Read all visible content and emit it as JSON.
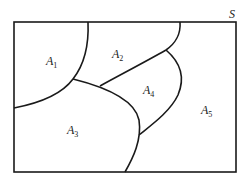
{
  "diagram": {
    "universe_label": "S",
    "regions": [
      {
        "id": "A1",
        "letter": "A",
        "sub": "1"
      },
      {
        "id": "A2",
        "letter": "A",
        "sub": "2"
      },
      {
        "id": "A3",
        "letter": "A",
        "sub": "3"
      },
      {
        "id": "A4",
        "letter": "A",
        "sub": "4"
      },
      {
        "id": "A5",
        "letter": "A",
        "sub": "5"
      }
    ],
    "colors": {
      "stroke": "#1a1a1a",
      "background": "#ffffff"
    }
  }
}
